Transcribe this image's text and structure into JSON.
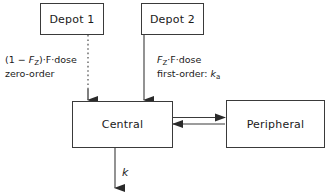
{
  "diagram": {
    "nodes": {
      "depot1": "Depot 1",
      "depot2": "Depot 2",
      "central": "Central",
      "peripheral": "Peripheral"
    },
    "edges": {
      "zero_order": {
        "line1_prefix": "(1 − ",
        "line1_var": "F",
        "line1_sub": "Z",
        "line1_suffix": ")·F·dose",
        "line2": "zero-order",
        "style": "dotted",
        "from": "Depot 1",
        "to": "Central"
      },
      "first_order": {
        "line1_var": "F",
        "line1_sub": "Z",
        "line1_suffix": "·F·dose",
        "line2_prefix": "first-order: ",
        "line2_var": "k",
        "line2_sub": "a",
        "style": "solid",
        "from": "Depot 2",
        "to": "Central"
      },
      "distribution": {
        "label": "",
        "style": "double-solid-bidirectional",
        "from": "Central",
        "to": "Peripheral"
      },
      "elimination": {
        "label": "k",
        "style": "solid",
        "from": "Central",
        "to": "out"
      }
    },
    "colors": {
      "stroke": "#3a3a3a",
      "text": "#1a1a1a",
      "background": "#ffffff"
    }
  }
}
